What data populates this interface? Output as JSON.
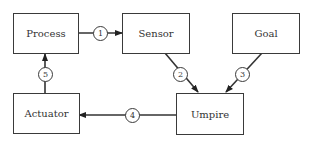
{
  "diagram": {
    "nodes": [
      {
        "id": "process",
        "label": "Process"
      },
      {
        "id": "sensor",
        "label": "Sensor"
      },
      {
        "id": "goal",
        "label": "Goal"
      },
      {
        "id": "actuator",
        "label": "Actuator"
      },
      {
        "id": "umpire",
        "label": "Umpire"
      }
    ],
    "edges": [
      {
        "label": "1",
        "from": "process",
        "to": "sensor"
      },
      {
        "label": "2",
        "from": "sensor",
        "to": "umpire"
      },
      {
        "label": "3",
        "from": "goal",
        "to": "umpire"
      },
      {
        "label": "4",
        "from": "umpire",
        "to": "actuator"
      },
      {
        "label": "5",
        "from": "actuator",
        "to": "process"
      }
    ]
  }
}
